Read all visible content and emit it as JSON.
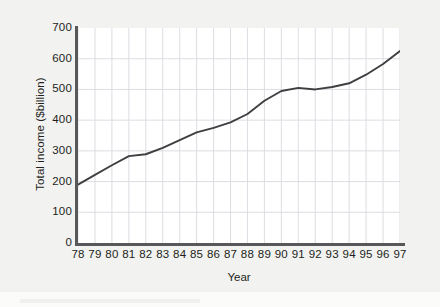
{
  "chart_data": {
    "type": "line",
    "title": "",
    "xlabel": "Year",
    "ylabel": "Total income ($billion)",
    "xlim": [
      78,
      97
    ],
    "ylim": [
      0,
      700
    ],
    "grid": true,
    "legend": null,
    "y_ticks": [
      0,
      100,
      200,
      300,
      400,
      500,
      600,
      700
    ],
    "y_tick_labels": [
      "0",
      "100",
      "200",
      "300",
      "400",
      "500",
      "600",
      "700"
    ],
    "x_tick_labels": [
      "78",
      "79",
      "80",
      "81",
      "82",
      "83",
      "84",
      "85",
      "86",
      "87",
      "88",
      "89",
      "90",
      "91",
      "92",
      "93",
      "94",
      "95",
      "96",
      "97"
    ],
    "categories": [
      78,
      79,
      80,
      81,
      82,
      83,
      84,
      85,
      86,
      87,
      88,
      89,
      90,
      91,
      92,
      93,
      94,
      95,
      96,
      97
    ],
    "values": [
      190,
      222,
      253,
      283,
      289,
      310,
      335,
      360,
      375,
      393,
      420,
      463,
      495,
      505,
      500,
      508,
      520,
      548,
      583,
      625
    ],
    "series": [
      {
        "name": "Total income",
        "values": [
          190,
          222,
          253,
          283,
          289,
          310,
          335,
          360,
          375,
          393,
          420,
          463,
          495,
          505,
          500,
          508,
          520,
          548,
          583,
          625
        ]
      }
    ],
    "line_color": "#3f3f41",
    "grid_color": "#d9d9e0",
    "axis_color": "#58585a",
    "plot_background": "#ffffff",
    "figure_background": "#f2f2f0"
  }
}
